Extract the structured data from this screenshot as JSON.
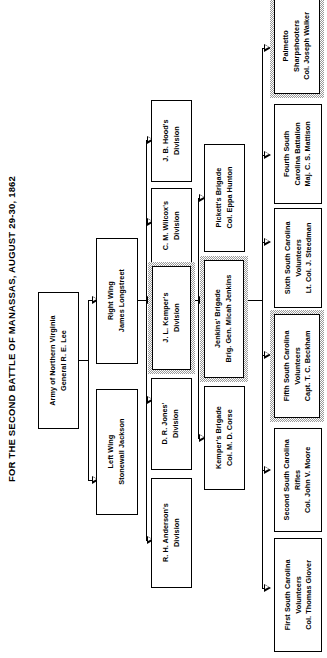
{
  "title": "FOR THE SECOND BATTLE OF MANASSAS, AUGUST 29-30, 1862",
  "colors": {
    "background": "#ffffff",
    "line": "#000000",
    "box_border": "#000000",
    "highlight_halo": "#9a9a9a"
  },
  "levels": {
    "army_label": "Army",
    "wing_label": "Wing",
    "division_label": "Division",
    "brigade_label": "Brigade",
    "regiment_label": "Regiment"
  },
  "army": {
    "name": "Army of Northern Virginia",
    "commander": "General R. E. Lee",
    "highlight": false
  },
  "wings": [
    {
      "name": "Right Wing",
      "commander": "James Longstreet",
      "highlight": false
    },
    {
      "name": "Left Wing",
      "commander": "Stonewall Jackson",
      "highlight": false
    }
  ],
  "divisions": [
    {
      "name": "J. B. Hood's",
      "unit": "Division",
      "highlight": false
    },
    {
      "name": "C. M. Wilcox's",
      "unit": "Division",
      "highlight": false
    },
    {
      "name": "J. L. Kemper's",
      "unit": "Division",
      "highlight": true
    },
    {
      "name": "D. R. Jones'",
      "unit": "Division",
      "highlight": false
    },
    {
      "name": "R. H. Anderson's",
      "unit": "Division",
      "highlight": false
    }
  ],
  "brigades": [
    {
      "name": "Pickett's Brigade",
      "commander": "Col. Eppa Hunton",
      "highlight": false
    },
    {
      "name": "Jenkins' Brigade",
      "commander": "Brig. Gen. Micah Jenkins",
      "highlight": true
    },
    {
      "name": "Kemper's Brigade",
      "commander": "Col. M. D. Corse",
      "highlight": false
    }
  ],
  "regiments": [
    {
      "line1": "Palmetto",
      "line2": "Sharpshooters",
      "line3": "Col. Joseph Walker",
      "highlight": true
    },
    {
      "line1": "Fourth South",
      "line2": "Carolina Battalion",
      "line3": "Maj. C. S. Mattison",
      "highlight": false
    },
    {
      "line1": "Sixth South Carolina",
      "line2": "Volunteers",
      "line3": "Lt. Col. J. Steedman",
      "highlight": false
    },
    {
      "line1": "Fifth South Carolina",
      "line2": "Volunteers",
      "line3": "Capt. T. C. Beckham",
      "highlight": true
    },
    {
      "line1": "Second South Carolina",
      "line2": "Rifles",
      "line3": "Col. John V. Moore",
      "highlight": false
    },
    {
      "line1": "First South Carolina",
      "line2": "Volunteers",
      "line3": "Col. Thomas Glover",
      "highlight": false
    }
  ]
}
